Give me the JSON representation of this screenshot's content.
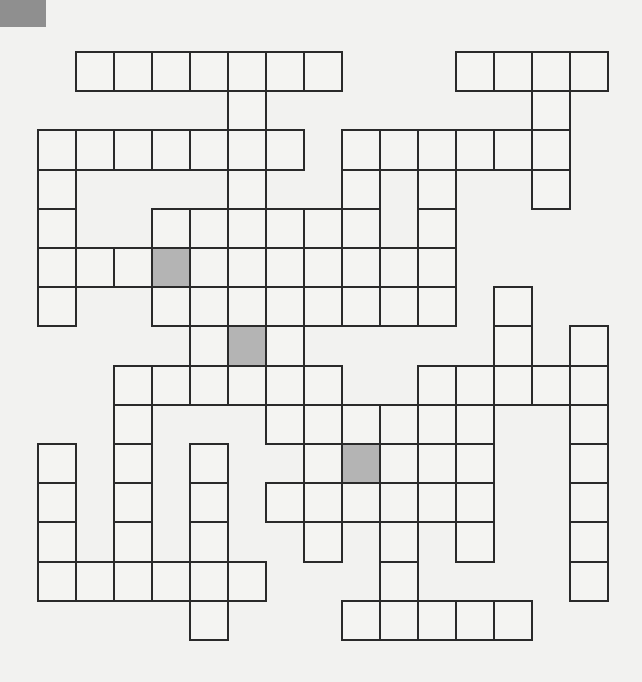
{
  "puzzle": {
    "type": "crossword-grid",
    "columns": 15,
    "rows": 15,
    "origin_x": 38,
    "origin_y": 52,
    "cell_w": 38,
    "cell_h": 39.2,
    "colors": {
      "line": "#2a2a2a",
      "cell": "#f4f4f2",
      "shaded": "#b4b4b4",
      "background": "#f2f2f0",
      "corner_mark": "#8f8f8f"
    },
    "rows_cells": [
      {
        "row": 0,
        "cols": [
          1,
          2,
          3,
          4,
          5,
          6,
          7,
          11,
          12,
          13,
          14
        ]
      },
      {
        "row": 1,
        "cols": [
          5,
          13
        ]
      },
      {
        "row": 2,
        "cols": [
          0,
          1,
          2,
          3,
          4,
          5,
          6,
          8,
          9,
          10,
          11,
          12,
          13
        ]
      },
      {
        "row": 3,
        "cols": [
          0,
          5,
          8,
          10,
          13
        ]
      },
      {
        "row": 4,
        "cols": [
          0,
          3,
          4,
          5,
          6,
          7,
          8,
          10
        ]
      },
      {
        "row": 5,
        "cols": [
          0,
          1,
          2,
          3,
          4,
          5,
          6,
          7,
          8,
          9,
          10
        ]
      },
      {
        "row": 6,
        "cols": [
          0,
          3,
          4,
          5,
          6,
          7,
          8,
          9,
          10,
          12
        ]
      },
      {
        "row": 7,
        "cols": [
          4,
          5,
          6,
          12,
          14
        ]
      },
      {
        "row": 8,
        "cols": [
          2,
          3,
          4,
          5,
          6,
          7,
          10,
          11,
          12,
          13,
          14
        ]
      },
      {
        "row": 9,
        "cols": [
          2,
          6,
          7,
          8,
          9,
          10,
          11,
          14
        ]
      },
      {
        "row": 10,
        "cols": [
          0,
          2,
          4,
          7,
          8,
          9,
          10,
          11,
          14
        ]
      },
      {
        "row": 11,
        "cols": [
          0,
          2,
          4,
          6,
          7,
          8,
          9,
          10,
          11,
          14
        ]
      },
      {
        "row": 12,
        "cols": [
          0,
          2,
          4,
          7,
          9,
          11,
          14
        ]
      },
      {
        "row": 13,
        "cols": [
          0,
          1,
          2,
          3,
          4,
          5,
          9,
          14
        ]
      },
      {
        "row": 14,
        "cols": [
          4,
          8,
          9,
          10,
          11,
          12
        ]
      }
    ],
    "shaded_cells": [
      [
        5,
        3
      ],
      [
        7,
        5
      ],
      [
        10,
        8
      ]
    ]
  }
}
